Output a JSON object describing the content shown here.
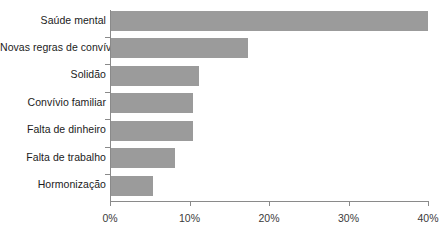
{
  "chart_data": {
    "type": "bar",
    "orientation": "horizontal",
    "title": "",
    "subtitle": "",
    "xlabel": "",
    "ylabel": "",
    "grid": false,
    "legend": "none",
    "xlim": [
      0,
      40
    ],
    "xtick_labels": [
      "0%",
      "10%",
      "20%",
      "30%",
      "40%"
    ],
    "xtick_values": [
      0,
      10,
      20,
      30,
      40
    ],
    "categories": [
      "Saúde mental",
      "Novas regras de convívio",
      "Solidão",
      "Convívio familiar",
      "Falta de dinheiro",
      "Falta de trabalho",
      "Hormonização"
    ],
    "values": [
      40,
      17.3,
      11.2,
      10.4,
      10.4,
      8.2,
      5.4
    ],
    "value_labels": [
      "40%",
      "17.3%",
      "11.2%",
      "10.4%",
      "10.4%",
      "8.2%",
      "5.4%"
    ],
    "bar_color": "#9b9b9b",
    "axis_color": "#8a8a8a",
    "label_color": "#1b1b1b",
    "tick_label_color": "#3a3a3a"
  }
}
